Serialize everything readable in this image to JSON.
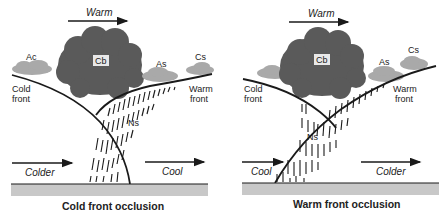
{
  "panels": [
    {
      "id": "cold",
      "caption": "Cold front occlusion",
      "top_arrow_label": "Warm",
      "left_arrow_label": "Colder",
      "right_arrow_label": "Cool",
      "clouds": {
        "cb": "Cb",
        "ac": "Ac",
        "as": "As",
        "cs": "Cs",
        "ns": "Ns"
      },
      "left_front_label": [
        "Cold",
        "front"
      ],
      "right_front_label": [
        "Warm",
        "front"
      ]
    },
    {
      "id": "warm",
      "caption": "Warm front occlusion",
      "top_arrow_label": "Warm",
      "left_arrow_label": "Cool",
      "right_arrow_label": "Colder",
      "clouds": {
        "cb": "Cb",
        "as": "As",
        "cs": "Cs",
        "ns": "Ns"
      },
      "left_front_label": [
        "Cold",
        "front"
      ],
      "right_front_label": [
        "Warm",
        "front"
      ]
    }
  ],
  "colors": {
    "cb_cloud": "#5a5a5a",
    "light_cloud": "#a9a9a9",
    "ground": "#c8c8c8",
    "line": "#1a1a1a"
  }
}
